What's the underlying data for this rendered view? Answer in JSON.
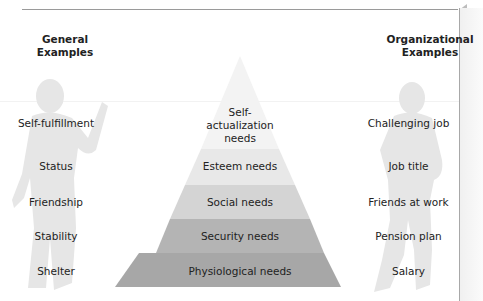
{
  "headers": {
    "left": "General\nExamples",
    "left_line1": "General",
    "left_line2": "Examples",
    "right_line1": "Organizational",
    "right_line2": "Examples"
  },
  "layers": [
    {
      "label_lines": [
        "Self-",
        "actualization",
        "needs"
      ],
      "general": "Self-fulfillment",
      "organizational": "Challenging job",
      "color": "#f3f3f3"
    },
    {
      "label": "Esteem needs",
      "general": "Status",
      "organizational": "Job title",
      "color": "#e9e9e9"
    },
    {
      "label": "Social needs",
      "general": "Friendship",
      "organizational": "Friends at work",
      "color": "#d6d6d6"
    },
    {
      "label": "Security needs",
      "general": "Stability",
      "organizational": "Pension plan",
      "color": "#b3b3b3"
    },
    {
      "label": "Physiological needs",
      "general": "Shelter",
      "organizational": "Salary",
      "color": "#a6a6a6"
    }
  ],
  "silhouettes": {
    "left": "person-gesturing-icon",
    "right": "person-standing-icon"
  }
}
